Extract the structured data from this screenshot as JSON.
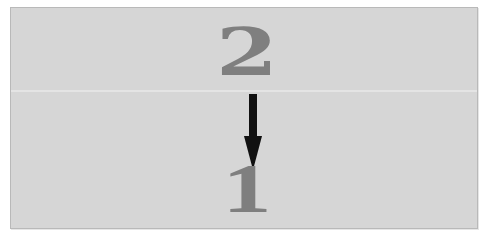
{
  "diagram": {
    "top_label": "2",
    "bottom_label": "1",
    "arrow": {
      "direction": "down",
      "from": "2",
      "to": "1",
      "color": "#111111"
    },
    "colors": {
      "background": "#d6d6d6",
      "numeral": "#7f7f7f",
      "border": "#b9b9b9"
    }
  }
}
